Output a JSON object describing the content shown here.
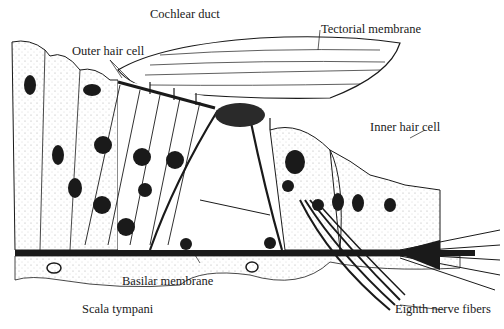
{
  "diagram": {
    "labels": {
      "cochlear_duct": "Cochlear duct",
      "tectorial_membrane": "Tectorial membrane",
      "outer_hair_cell": "Outer hair cell",
      "inner_hair_cell": "Inner hair cell",
      "basilar_membrane": "Basilar membrane",
      "scala_tympani": "Scala tympani",
      "eighth_nerve_fibers": "Eighth nerve fibers"
    },
    "colors": {
      "ink": "#1a1a1a",
      "stipple": "#9a9a9a",
      "background": "#ffffff"
    }
  }
}
